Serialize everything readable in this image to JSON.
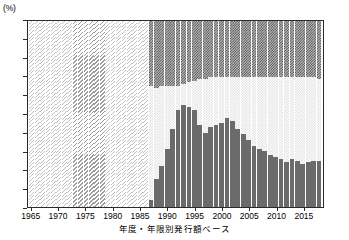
{
  "chart_data": {
    "type": "bar",
    "stacked": true,
    "title": "",
    "subtitle": "",
    "xlabel": "年度・年限別発行額ベース",
    "ylabel": "",
    "unit_label": "(%)",
    "ylim": [
      0,
      100
    ],
    "ytick_labels": [
      "0",
      "10",
      "20",
      "30",
      "40",
      "50",
      "60",
      "70",
      "80",
      "90",
      "100"
    ],
    "ytick_values": [
      0,
      10,
      20,
      30,
      40,
      50,
      60,
      70,
      80,
      90,
      100
    ],
    "xtick_labels": [
      "1965",
      "1970",
      "1975",
      "1980",
      "1985",
      "1990",
      "1995",
      "2000",
      "2005",
      "2010",
      "2015"
    ],
    "xtick_values": [
      1965,
      1970,
      1975,
      1980,
      1985,
      1990,
      1995,
      2000,
      2005,
      2010,
      2015
    ],
    "grid": false,
    "legend": "none",
    "legend_entries": [],
    "x": [
      1965,
      1966,
      1967,
      1968,
      1969,
      1970,
      1971,
      1972,
      1973,
      1974,
      1975,
      1976,
      1977,
      1978,
      1979,
      1980,
      1981,
      1982,
      1983,
      1984,
      1985,
      1986,
      1987,
      1988,
      1989,
      1990,
      1991,
      1992,
      1993,
      1994,
      1995,
      1996,
      1997,
      1998,
      1999,
      2000,
      2001,
      2002,
      2003,
      2004,
      2005,
      2006,
      2007,
      2008,
      2009,
      2010,
      2011,
      2012,
      2013,
      2014,
      2015,
      2016,
      2017,
      2018
    ],
    "series": [
      {
        "name": "short-term",
        "pattern": "solid-dark",
        "values": [
          0,
          0,
          0,
          0,
          0,
          0,
          0,
          0,
          0,
          0,
          0,
          0,
          0,
          0,
          0,
          0,
          0,
          0,
          0,
          0,
          0,
          0,
          4,
          15,
          22,
          31,
          42,
          52,
          55,
          54,
          52,
          44,
          40,
          43,
          44,
          45,
          48,
          46,
          42,
          39,
          36,
          33,
          31,
          30,
          28,
          27,
          26,
          24,
          26,
          25,
          23,
          24,
          25,
          25
        ]
      },
      {
        "name": "medium-term",
        "pattern": "light-hatch",
        "values": [
          100,
          100,
          100,
          100,
          100,
          100,
          100,
          100,
          100,
          100,
          100,
          100,
          100,
          100,
          100,
          100,
          100,
          100,
          100,
          100,
          100,
          100,
          61,
          49,
          43,
          34,
          23,
          13,
          11,
          13,
          16,
          25,
          29,
          27,
          26,
          25,
          22,
          24,
          28,
          31,
          34,
          37,
          39,
          40,
          42,
          43,
          44,
          46,
          44,
          45,
          47,
          46,
          45,
          44
        ]
      },
      {
        "name": "long-term",
        "pattern": "dark-crosshatch",
        "values": [
          0,
          0,
          0,
          0,
          0,
          0,
          0,
          0,
          0,
          0,
          0,
          0,
          0,
          0,
          0,
          0,
          0,
          0,
          0,
          0,
          0,
          0,
          35,
          36,
          35,
          35,
          35,
          35,
          34,
          33,
          32,
          31,
          31,
          30,
          30,
          30,
          30,
          30,
          30,
          30,
          30,
          30,
          30,
          30,
          30,
          30,
          30,
          30,
          30,
          30,
          30,
          30,
          30,
          31
        ]
      }
    ],
    "early_single_fill_until": 1986,
    "early_dense_band": [
      1973,
      1978
    ]
  }
}
